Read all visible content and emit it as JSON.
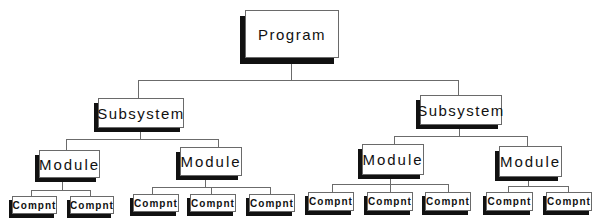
{
  "diagram": {
    "type": "hierarchy-tree",
    "root": {
      "label": "Program",
      "children": [
        {
          "label": "Subsystem",
          "children": [
            {
              "label": "Module",
              "children": [
                {
                  "label": "Compnt"
                },
                {
                  "label": "Compnt"
                }
              ]
            },
            {
              "label": "Module",
              "children": [
                {
                  "label": "Compnt"
                },
                {
                  "label": "Compnt"
                },
                {
                  "label": "Compnt"
                }
              ]
            }
          ]
        },
        {
          "label": "Subsystem",
          "children": [
            {
              "label": "Module",
              "children": [
                {
                  "label": "Compnt"
                },
                {
                  "label": "Compnt"
                },
                {
                  "label": "Compnt"
                }
              ]
            },
            {
              "label": "Module",
              "children": [
                {
                  "label": "Compnt"
                },
                {
                  "label": "Compnt"
                }
              ]
            }
          ]
        }
      ]
    },
    "labels": {
      "program": "Program",
      "subsystem_1": "Subsystem",
      "subsystem_2": "Subsystem",
      "module_1": "Module",
      "module_2": "Module",
      "module_3": "Module",
      "module_4": "Module",
      "compnt": [
        "Compnt",
        "Compnt",
        "Compnt",
        "Compnt",
        "Compnt",
        "Compnt",
        "Compnt",
        "Compnt",
        "Compnt",
        "Compnt"
      ]
    },
    "colors": {
      "box_fill": "#ffffff",
      "box_border": "#6a6a6a",
      "shadow": "#111111",
      "connector": "#6b6b6b",
      "text": "#111111"
    }
  }
}
